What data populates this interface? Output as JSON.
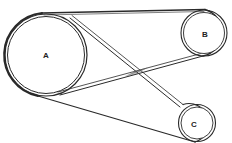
{
  "diagram": {
    "type": "belt-and-pulley",
    "colors": {
      "stroke": "#2a2a2a",
      "background": "#ffffff"
    },
    "pulleys": [
      {
        "id": "A",
        "label": "A",
        "cx": 46,
        "cy": 55,
        "r_outer": 42,
        "r_inner": 39
      },
      {
        "id": "B",
        "label": "B",
        "cx": 204,
        "cy": 33,
        "r_outer": 24,
        "r_inner": 21
      },
      {
        "id": "C",
        "label": "C",
        "cx": 197,
        "cy": 123,
        "r_outer": 19,
        "r_inner": 16
      }
    ],
    "belt_segments": [
      {
        "name": "top-belt-A-to-B",
        "from": "A",
        "to": "B"
      },
      {
        "name": "bottom-belt-A-to-C",
        "from": "A",
        "to": "C"
      },
      {
        "name": "crossing-belt-A-to-C",
        "from": "A",
        "to": "C",
        "crossed": true
      },
      {
        "name": "crossing-belt-A-to-B",
        "from": "A",
        "to": "B",
        "crossed": true
      }
    ]
  }
}
